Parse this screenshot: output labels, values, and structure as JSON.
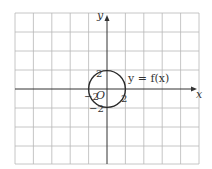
{
  "diagram": {
    "x_axis_label": "x",
    "y_axis_label": "y",
    "origin_label": "O",
    "function_label": "y = f(x)",
    "tick_labels": {
      "top": "2",
      "right": "2",
      "left": "−2",
      "bottom": "−2"
    },
    "grid": {
      "columns": 10,
      "rows": 8,
      "unit_per_cell": 2
    },
    "curve": {
      "shape": "circle",
      "center": [
        0,
        0
      ],
      "radius": 2
    },
    "colors": {
      "grid": "#b8b8b8",
      "axis": "#333333",
      "curve": "#2a2a2a"
    }
  }
}
